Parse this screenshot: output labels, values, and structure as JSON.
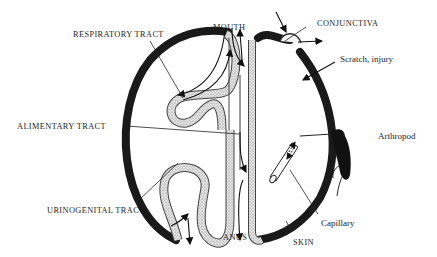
{
  "diagram": {
    "type": "anatomical schematic",
    "colors": {
      "skin": "#1a1a1a",
      "mucosa_fill": "#d9d9d9",
      "line": "#222222",
      "background": "#ffffff"
    },
    "labels": {
      "mouth": "MOUTH",
      "conjunctiva": "CONJUNCTIVA",
      "respiratory": "RESPIRATORY TRACT",
      "scratch": "Scratch, injury",
      "alimentary": "ALIMENTARY TRACT",
      "arthropod": "Arthropod",
      "urinogenital": "URINOGENITAL TRACT",
      "capillary": "Capillary",
      "anus": "ANUS",
      "skin": "SKIN"
    },
    "icons": [
      "arrow-in",
      "arrow-out",
      "arthropod-insect",
      "capillary-tube"
    ]
  }
}
